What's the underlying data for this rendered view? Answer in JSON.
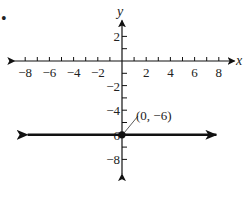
{
  "chart_data": {
    "type": "line",
    "title": "",
    "xlabel": "x",
    "ylabel": "y",
    "xlim": [
      -8,
      8
    ],
    "ylim": [
      -8,
      2
    ],
    "x_ticks": [
      -8,
      -7,
      -6,
      -5,
      -4,
      -3,
      -2,
      -1,
      1,
      2,
      3,
      4,
      5,
      6,
      7,
      8
    ],
    "x_tick_labels": [
      "−8",
      "−6",
      "−4",
      "−2",
      "2",
      "4",
      "6",
      "8"
    ],
    "x_tick_label_values": [
      -8,
      -6,
      -4,
      -2,
      2,
      4,
      6,
      8
    ],
    "y_ticks": [
      2,
      1,
      -1,
      -2,
      -3,
      -4,
      -5,
      -6,
      -7,
      -8
    ],
    "y_tick_labels": [
      "2",
      "−2",
      "−4",
      "−6",
      "−8"
    ],
    "y_tick_label_values": [
      2,
      -2,
      -4,
      -6,
      -8
    ],
    "grid": false,
    "series": [
      {
        "name": "y = -6",
        "kind": "horizontal line with arrows",
        "x": [
          -7.8,
          7.8
        ],
        "y": [
          -6,
          -6
        ]
      }
    ],
    "points": [
      {
        "x": 0,
        "y": -6,
        "label": "(0, −6)"
      }
    ],
    "annotations": [
      "(0, −6)"
    ],
    "marker_dot": "•"
  },
  "labels": {
    "x_axis": "x",
    "y_axis": "y",
    "point_label": "(0, −6)",
    "bullet": "•"
  },
  "colors": {
    "ink": "#111111",
    "background": "#ffffff"
  }
}
